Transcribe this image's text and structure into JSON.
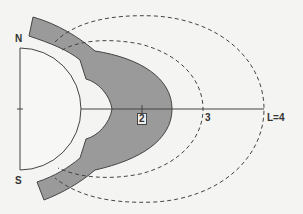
{
  "diagram": {
    "labels": {
      "north": "N",
      "south": "S",
      "l2": "2",
      "l3": "3",
      "l4": "L=4"
    },
    "colors": {
      "background": "#f4f4f2",
      "shaded_region": "#9a9a9a",
      "planet_fill": "#f7f7f5",
      "line": "#444444"
    },
    "shells": [
      {
        "L": 2,
        "style": "solid boundary of shaded region"
      },
      {
        "L": 3,
        "style": "dashed"
      },
      {
        "L": 4,
        "style": "dashed"
      }
    ]
  }
}
